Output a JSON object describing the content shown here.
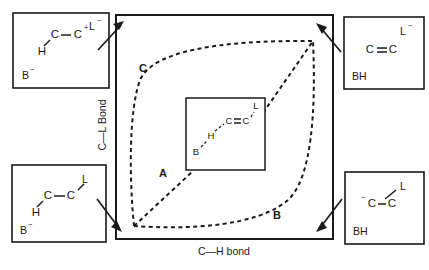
{
  "figure": {
    "type": "more-ofarrall-jencks-diagram",
    "axes": {
      "x_label": "C—H bond",
      "y_label": "C—L Bond"
    },
    "region_labels": [
      {
        "id": "A",
        "text": "A",
        "x": 163,
        "y": 174
      },
      {
        "id": "B",
        "text": "B",
        "x": 277,
        "y": 216
      },
      {
        "id": "C",
        "text": "C",
        "x": 143,
        "y": 69
      }
    ],
    "center_box": {
      "atoms": [
        {
          "text": "B",
          "x": 196,
          "y": 152
        },
        {
          "text": "H",
          "x": 211,
          "y": 136
        },
        {
          "text": "C",
          "x": 229,
          "y": 121
        },
        {
          "text": "C",
          "x": 246,
          "y": 121
        },
        {
          "text": "L",
          "x": 256,
          "y": 106
        }
      ]
    },
    "corner_boxes": [
      {
        "id": "top-left",
        "position": "top-left",
        "description": "carbocation-intermediate",
        "top_right_species": "L",
        "top_right_charge": "−",
        "bottom_left_species": "B",
        "bottom_left_charge": "−",
        "atoms": [
          {
            "text": "C",
            "x": 55,
            "y": 35
          },
          {
            "text": "C",
            "x": 78,
            "y": 35
          },
          {
            "text": "H",
            "x": 42,
            "y": 51
          }
        ],
        "carbon_charge": "+"
      },
      {
        "id": "top-right",
        "position": "top-right",
        "description": "alkene-product",
        "top_right_species": "L",
        "top_right_charge": "−",
        "bottom_left_species": "BH",
        "bottom_left_charge": "",
        "atoms": [
          {
            "text": "C",
            "x": 370,
            "y": 50
          },
          {
            "text": "C",
            "x": 393,
            "y": 50
          }
        ],
        "carbon_charge": ""
      },
      {
        "id": "bottom-left",
        "position": "bottom-left",
        "description": "reactant-substrate",
        "top_right_species": "L",
        "top_right_charge": "",
        "bottom_left_species": "B",
        "bottom_left_charge": "−",
        "atoms": [
          {
            "text": "C",
            "x": 48,
            "y": 196
          },
          {
            "text": "C",
            "x": 71,
            "y": 196
          },
          {
            "text": "H",
            "x": 36,
            "y": 212
          }
        ],
        "carbon_charge": ""
      },
      {
        "id": "bottom-right",
        "position": "bottom-right",
        "description": "carbanion-intermediate",
        "top_right_species": "L",
        "top_right_charge": "",
        "bottom_left_species": "BH",
        "bottom_left_charge": "",
        "atoms": [
          {
            "text": "C",
            "x": 372,
            "y": 204
          },
          {
            "text": "C",
            "x": 392,
            "y": 204
          }
        ],
        "carbon_charge": "−"
      }
    ]
  }
}
